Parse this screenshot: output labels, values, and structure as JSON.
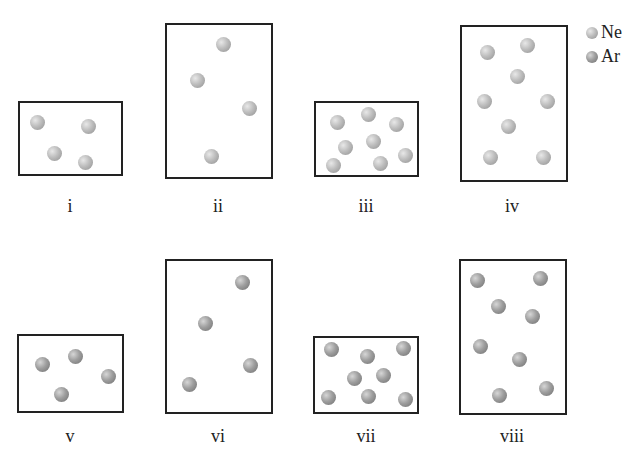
{
  "legend": [
    {
      "label": "Ne",
      "type": "ne"
    },
    {
      "label": "Ar",
      "type": "ar"
    }
  ],
  "boxes": [
    {
      "label": "i",
      "gas": "Ne",
      "x": 18,
      "y": 101,
      "w": 105,
      "h": 75,
      "particles": [
        [
          37,
          122
        ],
        [
          88,
          126
        ],
        [
          54,
          153
        ],
        [
          85,
          162
        ]
      ]
    },
    {
      "label": "ii",
      "gas": "Ne",
      "x": 165,
      "y": 23,
      "w": 108,
      "h": 156,
      "particles": [
        [
          223,
          44
        ],
        [
          197,
          80
        ],
        [
          249,
          108
        ],
        [
          211,
          156
        ]
      ]
    },
    {
      "label": "iii",
      "gas": "Ne",
      "x": 314,
      "y": 101,
      "w": 105,
      "h": 76,
      "particles": [
        [
          337,
          122
        ],
        [
          368,
          114
        ],
        [
          396,
          124
        ],
        [
          345,
          147
        ],
        [
          373,
          141
        ],
        [
          405,
          155
        ],
        [
          333,
          165
        ],
        [
          380,
          163
        ]
      ]
    },
    {
      "label": "iv",
      "gas": "Ne",
      "x": 460,
      "y": 25,
      "w": 108,
      "h": 157,
      "particles": [
        [
          487,
          52
        ],
        [
          527,
          45
        ],
        [
          517,
          76
        ],
        [
          484,
          101
        ],
        [
          547,
          101
        ],
        [
          508,
          126
        ],
        [
          490,
          157
        ],
        [
          543,
          157
        ]
      ]
    },
    {
      "label": "v",
      "gas": "Ar",
      "x": 17,
      "y": 334,
      "w": 107,
      "h": 79,
      "particles": [
        [
          42,
          364
        ],
        [
          75,
          356
        ],
        [
          108,
          376
        ],
        [
          61,
          394
        ]
      ]
    },
    {
      "label": "vi",
      "gas": "Ar",
      "x": 165,
      "y": 259,
      "w": 108,
      "h": 155,
      "particles": [
        [
          242,
          282
        ],
        [
          205,
          323
        ],
        [
          250,
          365
        ],
        [
          189,
          384
        ]
      ]
    },
    {
      "label": "vii",
      "gas": "Ar",
      "x": 313,
      "y": 336,
      "w": 106,
      "h": 78,
      "particles": [
        [
          331,
          349
        ],
        [
          367,
          356
        ],
        [
          403,
          348
        ],
        [
          354,
          378
        ],
        [
          383,
          375
        ],
        [
          328,
          397
        ],
        [
          368,
          396
        ],
        [
          405,
          399
        ]
      ]
    },
    {
      "label": "viii",
      "gas": "Ar",
      "x": 459,
      "y": 259,
      "w": 108,
      "h": 156,
      "particles": [
        [
          477,
          280
        ],
        [
          540,
          278
        ],
        [
          498,
          306
        ],
        [
          532,
          316
        ],
        [
          480,
          346
        ],
        [
          519,
          359
        ],
        [
          499,
          395
        ],
        [
          546,
          388
        ]
      ]
    }
  ],
  "labels_pos": [
    {
      "x": 70,
      "y": 196
    },
    {
      "x": 218,
      "y": 196
    },
    {
      "x": 366,
      "y": 196
    },
    {
      "x": 512,
      "y": 196
    },
    {
      "x": 70,
      "y": 426
    },
    {
      "x": 218,
      "y": 426
    },
    {
      "x": 366,
      "y": 426
    },
    {
      "x": 512,
      "y": 426
    }
  ]
}
